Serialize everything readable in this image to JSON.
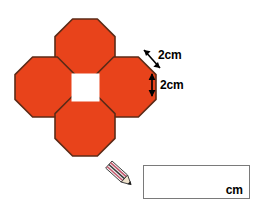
{
  "page": {
    "background_color": "#ffffff",
    "width": 254,
    "height": 212
  },
  "figure": {
    "name": "four-octagons-around-square",
    "fill_color": "#e8431b",
    "stroke_color": "#5c2b17",
    "center_square_color": "#ffffff",
    "octagon_count": 4,
    "octagons": [
      {
        "position": "top",
        "cx": 85,
        "cy": 49,
        "size": 60
      },
      {
        "position": "left",
        "cx": 45,
        "cy": 87,
        "size": 60
      },
      {
        "position": "right",
        "cx": 126,
        "cy": 87,
        "size": 60
      },
      {
        "position": "bottom",
        "cx": 85,
        "cy": 126,
        "size": 60
      }
    ],
    "center_square": {
      "x": 70,
      "y": 72,
      "size": 30
    }
  },
  "dimensions": {
    "slant_edge": {
      "label": "2cm",
      "value": 2,
      "unit": "cm",
      "arrow": "double-headed-diagonal"
    },
    "vertical_edge": {
      "label": "2cm",
      "value": 2,
      "unit": "cm",
      "arrow": "double-headed-vertical"
    }
  },
  "answer": {
    "unit_label": "cm",
    "value": "",
    "placeholder": "",
    "border_color": "#7a7a7a"
  },
  "icons": {
    "pencil": "pencil-icon"
  }
}
